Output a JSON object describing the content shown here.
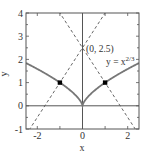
{
  "chart_data": {
    "type": "line",
    "title": "",
    "xlabel": "x",
    "ylabel": "y",
    "xlim": [
      -2.5,
      2.5
    ],
    "ylim": [
      -1,
      4
    ],
    "x_ticks": [
      "-2",
      "0",
      "2"
    ],
    "y_ticks": [
      "-1",
      "0",
      "1",
      "2",
      "3",
      "4"
    ],
    "grid": false,
    "series": [
      {
        "name": "y = x^(2/3)",
        "style": "solid",
        "color": "#777777",
        "function": "x^(2/3)"
      },
      {
        "name": "tangent line at (-1,1)",
        "style": "dashed",
        "color": "#555555",
        "x": [
          -2.5,
          2.5
        ],
        "y": [
          -1,
          4
        ],
        "function": "y = 1 + (2/3)... approx line through (-1,1) and (0,2.5)"
      },
      {
        "name": "tangent line at (1,1)",
        "style": "dashed",
        "color": "#555555",
        "x": [
          -2.5,
          2.5
        ],
        "y": [
          4,
          -1
        ]
      }
    ],
    "points": [
      {
        "x": -1,
        "y": 1,
        "marker": "square"
      },
      {
        "x": 1,
        "y": 1,
        "marker": "square"
      }
    ],
    "annotations": [
      {
        "text": "(0, 2.5)",
        "x": 0,
        "y": 2.5
      },
      {
        "text": "y = x",
        "superscript": "2/3",
        "x": 1.3,
        "y": 1.9
      }
    ],
    "reference_lines": [
      {
        "type": "horizontal",
        "y": 0
      },
      {
        "type": "vertical",
        "x": 0
      }
    ]
  }
}
